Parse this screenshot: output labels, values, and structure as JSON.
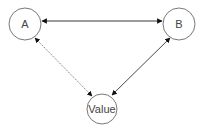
{
  "diagram": {
    "nodes": [
      {
        "id": "A",
        "label": "A",
        "cx": 25,
        "cy": 24,
        "r": 16
      },
      {
        "id": "B",
        "label": "B",
        "cx": 179,
        "cy": 24,
        "r": 16
      },
      {
        "id": "Value",
        "label": "Value",
        "cx": 102,
        "cy": 109,
        "r": 15
      }
    ],
    "edges": [
      {
        "from": "A",
        "to": "B",
        "style": "solid",
        "arrows": "both"
      },
      {
        "from": "A",
        "to": "Value",
        "style": "dotted",
        "arrows": "both"
      },
      {
        "from": "B",
        "to": "Value",
        "style": "solid",
        "arrows": "both"
      }
    ],
    "colors": {
      "stroke": "#555555",
      "edge": "#222222",
      "dotted_edge": "#777777",
      "text": "#444444"
    }
  }
}
